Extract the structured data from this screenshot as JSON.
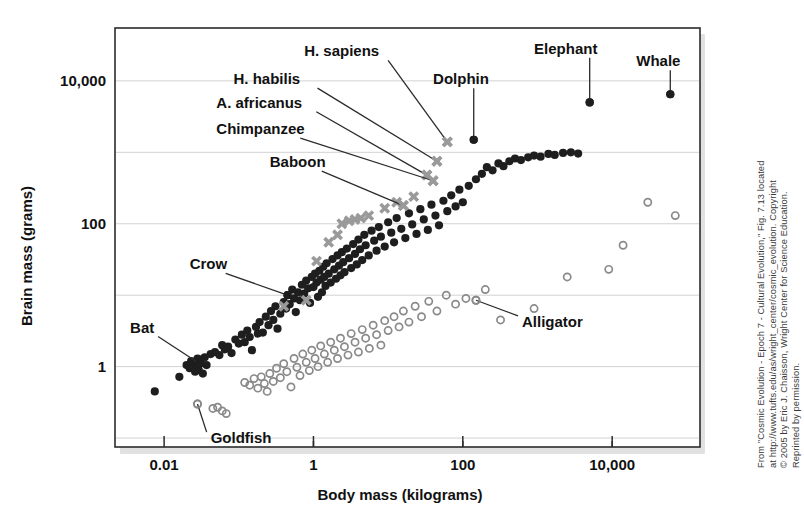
{
  "figure": {
    "credit": "From \"Cosmic Evolution - Epoch 7 - Cultural Evolution,\" Fig. 7.13 located at http://www.tufts.edu/as/wright_center/cosmic_evolution. Copyright © 2005 by Eric J. Chaisson, Wright Center for Science Education. Reprinted by permission.",
    "credit_lines": [
      "From \"Cosmic Evolution - Epoch 7 - Cultural Evolution,\" Fig. 7.13 located",
      "at http://www.tufts.edu/as/wright_center/cosmic_evolution. Copyright",
      "© 2005 by Eric J. Chaisson, Wright Center for Science Education.",
      "Reprinted by permission."
    ]
  },
  "chart_data": {
    "type": "scatter",
    "title": "",
    "xlabel": "Body mass (kilograms)",
    "ylabel": "Brain mass (grams)",
    "xscale": "log",
    "yscale": "log",
    "xlim": [
      0.0022,
      150000
    ],
    "ylim": [
      0.075,
      55000
    ],
    "grid": true,
    "gridlines_y": [
      10000,
      1000,
      100,
      10,
      1,
      0.1
    ],
    "xticks_major": [
      0.01,
      1,
      100,
      10000
    ],
    "xticks_major_labels": [
      "0.01",
      "1",
      "100",
      "10,000"
    ],
    "xticks_minor": [
      1,
      100,
      10000,
      1000000
    ],
    "yticks_major": [
      10000,
      100,
      1
    ],
    "yticks_major_labels": [
      "10,000",
      "100",
      "1"
    ],
    "legend_position": "none",
    "marker_types": {
      "filled-circle": "mammals and birds",
      "open-circle": "reptiles and fish",
      "gray-cross": "primates and hominids"
    },
    "annotations": [
      {
        "label": "H. sapiens",
        "x": 62,
        "y": 1400,
        "marker": "gray-cross",
        "label_x": 0.75,
        "label_y": 22000
      },
      {
        "label": "H. habilis",
        "x": 45,
        "y": 750,
        "marker": "gray-cross",
        "label_x": 0.085,
        "label_y": 9000
      },
      {
        "label": "A. africanus",
        "x": 33,
        "y": 480,
        "marker": "gray-cross",
        "label_x": 0.05,
        "label_y": 4200
      },
      {
        "label": "Chimpanzee",
        "x": 40,
        "y": 400,
        "marker": "gray-cross",
        "label_x": 0.05,
        "label_y": 1800
      },
      {
        "label": "Baboon",
        "x": 16,
        "y": 180,
        "marker": "gray-cross",
        "label_x": 0.26,
        "label_y": 620
      },
      {
        "label": "Dolphin",
        "x": 140,
        "y": 1500,
        "marker": "filled-circle",
        "label_x": 40,
        "label_y": 9000
      },
      {
        "label": "Elephant",
        "x": 5000,
        "y": 5000,
        "marker": "filled-circle",
        "label_x": 900,
        "label_y": 24000
      },
      {
        "label": "Whale",
        "x": 60000,
        "y": 6500,
        "marker": "filled-circle",
        "label_x": 21000,
        "label_y": 16000
      },
      {
        "label": "Crow",
        "x": 0.45,
        "y": 10,
        "marker": "filled-circle",
        "label_x": 0.022,
        "label_y": 23
      },
      {
        "label": "Bat",
        "x": 0.03,
        "y": 1.1,
        "marker": "filled-circle",
        "label_x": 0.0035,
        "label_y": 3.0
      },
      {
        "label": "Goldfish",
        "x": 0.028,
        "y": 0.3,
        "marker": "open-circle",
        "label_x": 0.042,
        "label_y": 0.085
      },
      {
        "label": "Alligator",
        "x": 150,
        "y": 8.5,
        "marker": "open-circle",
        "label_x": 620,
        "label_y": 3.6
      }
    ],
    "series": [
      {
        "name": "filled-circle",
        "marker": "filled-circle",
        "points": [
          [
            0.0075,
            0.45
          ],
          [
            0.016,
            0.72
          ],
          [
            0.02,
            1.05
          ],
          [
            0.022,
            0.95
          ],
          [
            0.023,
            1.2
          ],
          [
            0.025,
            1.0
          ],
          [
            0.026,
            0.85
          ],
          [
            0.027,
            1.15
          ],
          [
            0.028,
            1.3
          ],
          [
            0.029,
            0.9
          ],
          [
            0.03,
            1.1
          ],
          [
            0.031,
            1.25
          ],
          [
            0.033,
            0.8
          ],
          [
            0.035,
            1.35
          ],
          [
            0.037,
            1.05
          ],
          [
            0.042,
            1.5
          ],
          [
            0.048,
            1.6
          ],
          [
            0.055,
            1.45
          ],
          [
            0.06,
            2.0
          ],
          [
            0.065,
            1.75
          ],
          [
            0.072,
            1.9
          ],
          [
            0.08,
            1.55
          ],
          [
            0.09,
            2.4
          ],
          [
            0.1,
            2.1
          ],
          [
            0.11,
            2.8
          ],
          [
            0.12,
            2.2
          ],
          [
            0.13,
            3.2
          ],
          [
            0.14,
            2.6
          ],
          [
            0.15,
            1.7
          ],
          [
            0.17,
            3.6
          ],
          [
            0.18,
            2.9
          ],
          [
            0.19,
            4.2
          ],
          [
            0.21,
            3.0
          ],
          [
            0.23,
            5.0
          ],
          [
            0.25,
            3.8
          ],
          [
            0.27,
            6.0
          ],
          [
            0.29,
            4.5
          ],
          [
            0.31,
            7.0
          ],
          [
            0.33,
            3.4
          ],
          [
            0.36,
            5.5
          ],
          [
            0.4,
            8.0
          ],
          [
            0.43,
            6.5
          ],
          [
            0.45,
            10.0
          ],
          [
            0.48,
            7.5
          ],
          [
            0.52,
            12.0
          ],
          [
            0.55,
            9.0
          ],
          [
            0.58,
            5.8
          ],
          [
            0.62,
            11.0
          ],
          [
            0.66,
            8.5
          ],
          [
            0.7,
            14.0
          ],
          [
            0.75,
            10.5
          ],
          [
            0.8,
            16.0
          ],
          [
            0.85,
            12.5
          ],
          [
            0.9,
            7.8
          ],
          [
            0.95,
            18.0
          ],
          [
            1.0,
            13.0
          ],
          [
            1.05,
            20.0
          ],
          [
            1.1,
            15.0
          ],
          [
            1.15,
            9.5
          ],
          [
            1.2,
            22.0
          ],
          [
            1.25,
            16.5
          ],
          [
            1.3,
            11.0
          ],
          [
            1.35,
            25.0
          ],
          [
            1.4,
            18.0
          ],
          [
            1.45,
            13.5
          ],
          [
            1.5,
            28.0
          ],
          [
            1.6,
            20.0
          ],
          [
            1.7,
            15.0
          ],
          [
            1.8,
            32.0
          ],
          [
            1.9,
            23.0
          ],
          [
            2.0,
            17.0
          ],
          [
            2.1,
            36.0
          ],
          [
            2.2,
            26.0
          ],
          [
            2.3,
            19.0
          ],
          [
            2.4,
            40.0
          ],
          [
            2.5,
            29.0
          ],
          [
            2.6,
            21.0
          ],
          [
            2.8,
            45.0
          ],
          [
            3.0,
            33.0
          ],
          [
            3.2,
            24.0
          ],
          [
            3.4,
            52.0
          ],
          [
            3.6,
            38.0
          ],
          [
            3.8,
            27.0
          ],
          [
            4.0,
            60.0
          ],
          [
            4.2,
            44.0
          ],
          [
            4.5,
            31.0
          ],
          [
            4.8,
            70.0
          ],
          [
            5.0,
            50.0
          ],
          [
            5.5,
            36.0
          ],
          [
            6.0,
            80.0
          ],
          [
            6.5,
            58.0
          ],
          [
            7.0,
            42.0
          ],
          [
            7.5,
            90.0
          ],
          [
            8.0,
            66.0
          ],
          [
            9.0,
            48.0
          ],
          [
            10.0,
            105.0
          ],
          [
            11.0,
            75.0
          ],
          [
            12.0,
            55.0
          ],
          [
            13.0,
            120.0
          ],
          [
            15.0,
            85.0
          ],
          [
            17.0,
            63.0
          ],
          [
            19.0,
            140.0
          ],
          [
            21.0,
            98.0
          ],
          [
            24.0,
            72.0
          ],
          [
            27.0,
            160.0
          ],
          [
            30.0,
            115.0
          ],
          [
            34.0,
            82.0
          ],
          [
            38.0,
            185.0
          ],
          [
            43.0,
            130.0
          ],
          [
            48.0,
            95.0
          ],
          [
            55.0,
            210.0
          ],
          [
            62.0,
            150.0
          ],
          [
            70.0,
            250.0
          ],
          [
            80.0,
            175.0
          ],
          [
            90.0,
            300.0
          ],
          [
            100.0,
            200.0
          ],
          [
            120.0,
            340.0
          ],
          [
            140.0,
            1500.0
          ],
          [
            150.0,
            420.0
          ],
          [
            180.0,
            500.0
          ],
          [
            210.0,
            620.0
          ],
          [
            250.0,
            560.0
          ],
          [
            300.0,
            700.0
          ],
          [
            350.0,
            640.0
          ],
          [
            420.0,
            750.0
          ],
          [
            500.0,
            820.0
          ],
          [
            600.0,
            780.0
          ],
          [
            750.0,
            850.0
          ],
          [
            900.0,
            900.0
          ],
          [
            1100.0,
            870.0
          ],
          [
            1400.0,
            950.0
          ],
          [
            1700.0,
            920.0
          ],
          [
            2200.0,
            980.0
          ],
          [
            2800.0,
            1000.0
          ],
          [
            3500.0,
            960.0
          ],
          [
            5000.0,
            5000.0
          ],
          [
            60000.0,
            6500.0
          ]
        ]
      },
      {
        "name": "open-circle",
        "marker": "open-circle",
        "points": [
          [
            0.028,
            0.3
          ],
          [
            0.045,
            0.26
          ],
          [
            0.052,
            0.27
          ],
          [
            0.06,
            0.24
          ],
          [
            0.068,
            0.22
          ],
          [
            0.12,
            0.6
          ],
          [
            0.14,
            0.55
          ],
          [
            0.16,
            0.68
          ],
          [
            0.18,
            0.5
          ],
          [
            0.2,
            0.72
          ],
          [
            0.22,
            0.58
          ],
          [
            0.24,
            0.45
          ],
          [
            0.26,
            0.8
          ],
          [
            0.29,
            0.62
          ],
          [
            0.32,
            0.95
          ],
          [
            0.36,
            0.7
          ],
          [
            0.4,
            1.1
          ],
          [
            0.44,
            0.85
          ],
          [
            0.5,
            0.52
          ],
          [
            0.55,
            1.3
          ],
          [
            0.6,
            0.98
          ],
          [
            0.66,
            0.75
          ],
          [
            0.72,
            1.5
          ],
          [
            0.8,
            1.15
          ],
          [
            0.88,
            0.88
          ],
          [
            0.95,
            1.7
          ],
          [
            1.05,
            1.3
          ],
          [
            1.15,
            1.0
          ],
          [
            1.25,
            1.95
          ],
          [
            1.4,
            1.5
          ],
          [
            1.55,
            1.15
          ],
          [
            1.7,
            2.2
          ],
          [
            1.9,
            1.7
          ],
          [
            2.1,
            1.3
          ],
          [
            2.3,
            2.5
          ],
          [
            2.6,
            1.9
          ],
          [
            2.9,
            1.45
          ],
          [
            3.2,
            2.9
          ],
          [
            3.6,
            2.2
          ],
          [
            4.0,
            1.6
          ],
          [
            4.5,
            3.3
          ],
          [
            5.0,
            2.5
          ],
          [
            5.6,
            1.8
          ],
          [
            6.3,
            3.8
          ],
          [
            7.0,
            2.8
          ],
          [
            8.0,
            2.0
          ],
          [
            9.0,
            4.4
          ],
          [
            10.0,
            3.2
          ],
          [
            12.0,
            5.0
          ],
          [
            14.0,
            3.6
          ],
          [
            16.0,
            6.0
          ],
          [
            19.0,
            4.2
          ],
          [
            23.0,
            7.0
          ],
          [
            28.0,
            5.0
          ],
          [
            35.0,
            8.2
          ],
          [
            45.0,
            6.0
          ],
          [
            60.0,
            10.0
          ],
          [
            80.0,
            7.5
          ],
          [
            110.0,
            9.0
          ],
          [
            150.0,
            8.5
          ],
          [
            200.0,
            12.0
          ],
          [
            320.0,
            4.5
          ],
          [
            900.0,
            6.5
          ],
          [
            2500.0,
            18.0
          ],
          [
            9000.0,
            23.0
          ],
          [
            14000.0,
            50.0
          ],
          [
            30000.0,
            200.0
          ],
          [
            70000.0,
            130.0
          ]
        ]
      },
      {
        "name": "gray-cross",
        "marker": "gray-cross",
        "points": [
          [
            0.4,
            7.0
          ],
          [
            0.8,
            8.5
          ],
          [
            1.1,
            30.0
          ],
          [
            1.6,
            55.0
          ],
          [
            2.1,
            70.0
          ],
          [
            2.4,
            100.0
          ],
          [
            3.0,
            110.0
          ],
          [
            3.6,
            115.0
          ],
          [
            4.3,
            120.0
          ],
          [
            5.5,
            130.0
          ],
          [
            9.0,
            165.0
          ],
          [
            13.0,
            200.0
          ],
          [
            16.0,
            180.0
          ],
          [
            22.0,
            240.0
          ],
          [
            33.0,
            480.0
          ],
          [
            40.0,
            400.0
          ],
          [
            45.0,
            750.0
          ],
          [
            62.0,
            1400.0
          ]
        ]
      }
    ]
  }
}
